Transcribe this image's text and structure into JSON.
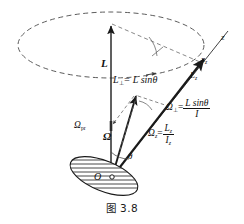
{
  "figure": {
    "caption": "图 3.8",
    "background_color": "#ffffff",
    "line_color": "#1a1a1a",
    "dash_color": "#555555"
  },
  "labels": {
    "angular_momentum": "L",
    "angular_momentum_perp_name": "L",
    "angular_momentum_perp_sub": "⊥",
    "angular_momentum_perp_value": "= L sin",
    "theta_symbol": "θ",
    "z_axis": "z",
    "x_axis_sub": "x",
    "x_axis_subscript": "z",
    "Lz_name": "L",
    "Lz_sub": "z",
    "omega_perp_name": "Ω",
    "omega_perp_sub": "⊥",
    "omega_perp_eq": "=",
    "omega_perp_num": "L sinθ",
    "omega_perp_den": "I",
    "omega_z_name": "Ω",
    "omega_z_sub": "z",
    "omega_z_eq": "=",
    "omega_z_num_name": "L",
    "omega_z_num_sub": "z",
    "omega_z_den_name": "I",
    "omega_z_den_sub": "z",
    "omega_pr_name": "Ω",
    "omega_pr_sub": "pr",
    "omega_vector": "Ω",
    "angle_theta": "θ",
    "origin": "O"
  },
  "geometry": {
    "precession_ellipse": {
      "cx": 111,
      "cy": 45,
      "rx": 93,
      "ry": 33,
      "style": "dashed"
    },
    "vertical_axis": {
      "x": 111,
      "y_top": 22,
      "y_bottom": 178
    },
    "z_axis": {
      "x1": 112,
      "y1": 177,
      "x2": 224,
      "y2": 34
    },
    "disk": {
      "cx": 104,
      "cy": 176,
      "rx": 36,
      "ry": 15,
      "rotation_deg": 22,
      "hatch_lines": 7
    },
    "omega_vector": {
      "x1": 112,
      "y1": 177,
      "x2": 136,
      "y2": 93
    },
    "lz_vector": {
      "x1": 112,
      "y1": 177,
      "x2": 206,
      "y2": 57
    }
  }
}
